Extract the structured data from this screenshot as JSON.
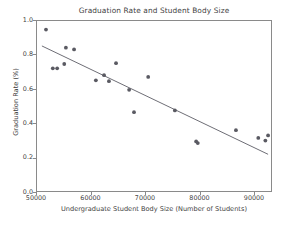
{
  "chart_data": {
    "type": "scatter",
    "title": "Graduation Rate and Student Body Size",
    "xlabel": "Undergraduate Student Body Size (Number of Students)",
    "ylabel": "Graduation Rate (%)",
    "xlim": [
      50000,
      93300
    ],
    "ylim": [
      0.0,
      1.0
    ],
    "grid": false,
    "legend": null,
    "marker_color": "#5a5a62",
    "line_color": "#6e6e76",
    "axis_color": "#8a8a8a",
    "xticks": [
      50000,
      60000,
      70000,
      80000,
      90000
    ],
    "xtick_labels": [
      "50000",
      "60000",
      "70000",
      "80000",
      "90000"
    ],
    "yticks": [
      0.0,
      0.2,
      0.4,
      0.6,
      0.8,
      1.0
    ],
    "ytick_labels": [
      "0.0",
      "0.2",
      "0.4",
      "0.6",
      "0.8",
      "1.0"
    ],
    "points": [
      {
        "x": 51650,
        "y": 0.95
      },
      {
        "x": 52900,
        "y": 0.725
      },
      {
        "x": 53700,
        "y": 0.725
      },
      {
        "x": 55000,
        "y": 0.75
      },
      {
        "x": 55300,
        "y": 0.845
      },
      {
        "x": 56800,
        "y": 0.835
      },
      {
        "x": 60800,
        "y": 0.655
      },
      {
        "x": 62300,
        "y": 0.685
      },
      {
        "x": 63200,
        "y": 0.65
      },
      {
        "x": 64500,
        "y": 0.755
      },
      {
        "x": 66900,
        "y": 0.6
      },
      {
        "x": 67800,
        "y": 0.47
      },
      {
        "x": 70400,
        "y": 0.675
      },
      {
        "x": 75300,
        "y": 0.48
      },
      {
        "x": 79200,
        "y": 0.3
      },
      {
        "x": 79500,
        "y": 0.29
      },
      {
        "x": 86500,
        "y": 0.365
      },
      {
        "x": 90600,
        "y": 0.32
      },
      {
        "x": 91900,
        "y": 0.305
      },
      {
        "x": 92400,
        "y": 0.335
      }
    ],
    "trendline": {
      "x0": 50900,
      "y0": 0.855,
      "x1": 92400,
      "y1": 0.225
    }
  }
}
